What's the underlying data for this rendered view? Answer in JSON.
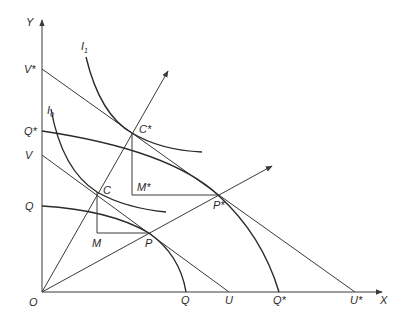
{
  "diagram": {
    "type": "economics-ppf-indifference",
    "axes": {
      "y_label": "Y",
      "x_label": "X",
      "origin_label": "O"
    },
    "y_axis_labels": {
      "v_star": "V*",
      "q_star": "Q*",
      "v": "V",
      "q": "Q"
    },
    "x_axis_labels": {
      "q": "Q",
      "u": "U",
      "q_star": "Q*",
      "u_star": "U*"
    },
    "curves": {
      "i1": {
        "label": "I",
        "subscript": "1"
      },
      "i0": {
        "label": "I",
        "subscript": "0"
      }
    },
    "points": {
      "c_star": "C*",
      "c": "C",
      "m_star": "M*",
      "m": "M",
      "p_star": "P*",
      "p": "P"
    },
    "colors": {
      "line": "#3a3a3a",
      "text": "#2a2a2a",
      "background": "#ffffff"
    }
  }
}
